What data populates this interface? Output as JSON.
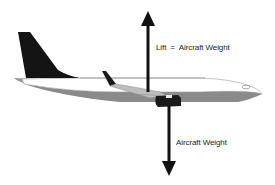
{
  "diagram": {
    "type": "force-diagram",
    "forces": [
      {
        "name": "Lift",
        "direction": "up",
        "label_left": "Lift",
        "label_equals": "=",
        "label_right": "Aircraft Weight"
      },
      {
        "name": "Aircraft Weight",
        "direction": "down",
        "label": "Aircraft Weight"
      }
    ],
    "colors": {
      "arrow": "#111111",
      "tail_fin": "#141414",
      "fuselage_belly": "#8a8a8a",
      "fuselage_top": "#ffffff",
      "outline": "#9a9a9a",
      "engine": "#1a1a1a",
      "text": "#222222"
    }
  }
}
